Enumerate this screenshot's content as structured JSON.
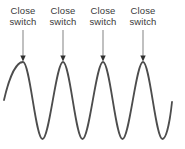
{
  "figure": {
    "background": "#ffffff",
    "text_color": "#3a3a3a",
    "annotations": [
      {
        "line1": "Close",
        "line2": "switch",
        "x": 23
      },
      {
        "line1": "Close",
        "line2": "switch",
        "x": 63
      },
      {
        "line1": "Close",
        "line2": "switch",
        "x": 103
      },
      {
        "line1": "Close",
        "line2": "switch",
        "x": 143
      }
    ],
    "arrow": {
      "line_color": "#8c8c8c",
      "head_color": "#303030",
      "top_y": 30,
      "head_base_y": 55.5,
      "tip_y": 61.5,
      "head_half_width": 2.7
    },
    "wave": {
      "color": "#4d4d4d",
      "stroke_width": 1.8,
      "peaks_x": [
        23,
        63,
        103,
        143
      ],
      "peak_y": 62,
      "trough_y": 139,
      "trough_offset": 19.5,
      "start": {
        "x": 4,
        "y": 100
      },
      "end": {
        "x": 172,
        "y": 102
      }
    }
  }
}
